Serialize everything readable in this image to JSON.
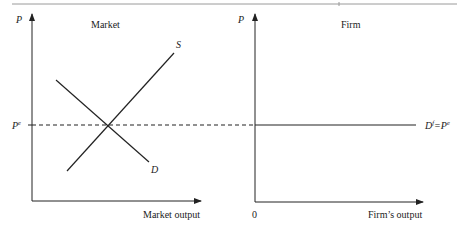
{
  "figure": {
    "type": "economics-diagram",
    "colors": {
      "line": "#222222",
      "rule": "#9a9a9a",
      "background": "#ffffff"
    }
  },
  "panels": [
    {
      "id": "market",
      "title": "Market",
      "y_axis_label": "P",
      "x_axis_label": "Market output",
      "price_label_base": "P",
      "price_label_sup": "e",
      "curves": [
        {
          "name": "S",
          "label": "S",
          "kind": "supply"
        },
        {
          "name": "D",
          "label": "D",
          "kind": "demand"
        }
      ]
    },
    {
      "id": "firm",
      "title": "Firm",
      "y_axis_label": "P",
      "x_axis_label": "Firm’s output",
      "origin_label": "0",
      "demand_label_base": "D",
      "demand_label_sup": "f",
      "demand_label_eq": "=P",
      "demand_label_sup2": "e"
    }
  ],
  "annotations": {
    "equilibrium_price_line": "dashed line at P^e linking market equilibrium to firm's horizontal demand"
  }
}
